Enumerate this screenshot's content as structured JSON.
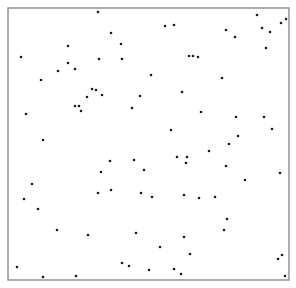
{
  "chart_data": {
    "type": "scatter",
    "title": "",
    "xlabel": "",
    "ylabel": "",
    "grid": false,
    "legend": null,
    "axes_ticks": false,
    "frame": {
      "x0": 8,
      "y0": 8,
      "x1": 289,
      "y1": 280
    },
    "coordinate_note": "points in screen pixel coordinates within a 296x288 canvas; frame box with no tick labels",
    "colors": {
      "points": "#1a1a1a",
      "frame": "#8a8a8a",
      "background": "#ffffff"
    },
    "points": [
      [
        98,
        12
      ],
      [
        111,
        33
      ],
      [
        165,
        26
      ],
      [
        174,
        25
      ],
      [
        121,
        44
      ],
      [
        68,
        46
      ],
      [
        21,
        57
      ],
      [
        99,
        59
      ],
      [
        122,
        59
      ],
      [
        189,
        56
      ],
      [
        193,
        56
      ],
      [
        198,
        57
      ],
      [
        68,
        63
      ],
      [
        58,
        71
      ],
      [
        75,
        69
      ],
      [
        41,
        80
      ],
      [
        151,
        75
      ],
      [
        92,
        89
      ],
      [
        96,
        90
      ],
      [
        102,
        95
      ],
      [
        140,
        96
      ],
      [
        182,
        92
      ],
      [
        87,
        97
      ],
      [
        75,
        106
      ],
      [
        79,
        106
      ],
      [
        81,
        111
      ],
      [
        26,
        114
      ],
      [
        132,
        108
      ],
      [
        171,
        130
      ],
      [
        43,
        140
      ],
      [
        110,
        161
      ],
      [
        134,
        160
      ],
      [
        177,
        157
      ],
      [
        187,
        157
      ],
      [
        186,
        163
      ],
      [
        101,
        172
      ],
      [
        144,
        170
      ],
      [
        32,
        184
      ],
      [
        98,
        193
      ],
      [
        111,
        190
      ],
      [
        141,
        193
      ],
      [
        152,
        197
      ],
      [
        184,
        195
      ],
      [
        199,
        198
      ],
      [
        215,
        197
      ],
      [
        24,
        199
      ],
      [
        38,
        209
      ],
      [
        57,
        230
      ],
      [
        88,
        235
      ],
      [
        136,
        233
      ],
      [
        184,
        237
      ],
      [
        160,
        247
      ],
      [
        190,
        254
      ],
      [
        122,
        263
      ],
      [
        129,
        266
      ],
      [
        149,
        270
      ],
      [
        174,
        269
      ],
      [
        181,
        274
      ],
      [
        17,
        267
      ],
      [
        43,
        277
      ],
      [
        76,
        276
      ],
      [
        226,
        30
      ],
      [
        235,
        37
      ],
      [
        257,
        15
      ],
      [
        262,
        28
      ],
      [
        270,
        32
      ],
      [
        281,
        23
      ],
      [
        286,
        19
      ],
      [
        266,
        48
      ],
      [
        222,
        78
      ],
      [
        201,
        112
      ],
      [
        236,
        117
      ],
      [
        264,
        117
      ],
      [
        272,
        129
      ],
      [
        238,
        136
      ],
      [
        229,
        144
      ],
      [
        209,
        151
      ],
      [
        226,
        166
      ],
      [
        245,
        180
      ],
      [
        280,
        173
      ],
      [
        227,
        219
      ],
      [
        224,
        230
      ],
      [
        278,
        259
      ],
      [
        282,
        255
      ],
      [
        285,
        276
      ]
    ]
  }
}
